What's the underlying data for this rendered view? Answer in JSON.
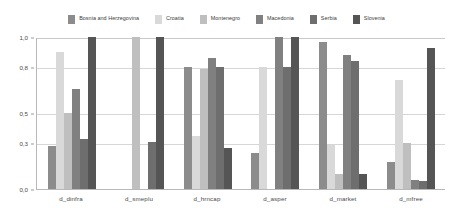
{
  "chart_data": {
    "type": "bar",
    "title": "",
    "subtitle": "",
    "xlabel": "",
    "ylabel": "",
    "ylim": [
      0.0,
      1.0
    ],
    "yticks": [
      "1,0",
      "0,8",
      "0,5",
      "0,3",
      "0,0"
    ],
    "ytick_values": [
      1.0,
      0.8,
      0.5,
      0.3,
      0.0
    ],
    "grid": true,
    "legend_position": "top",
    "categories": [
      "d_dinfra",
      "d_smeplu",
      "d_hrncap",
      "d_asper",
      "d_market",
      "d_mfree"
    ],
    "series": [
      {
        "name": "Bosnia and Herzegovina",
        "color": "#8c8c8c",
        "values": [
          0.28,
          0.0,
          0.8,
          0.24,
          0.97,
          0.18
        ]
      },
      {
        "name": "Croatia",
        "color": "#d9d9d9",
        "values": [
          0.9,
          0.0,
          0.35,
          0.8,
          0.29,
          0.72
        ]
      },
      {
        "name": "Montenegro",
        "color": "#bfbfbf",
        "values": [
          0.5,
          1.0,
          0.79,
          0.0,
          0.1,
          0.3
        ]
      },
      {
        "name": "Macedonia",
        "color": "#808080",
        "values": [
          0.66,
          0.0,
          0.86,
          1.0,
          0.88,
          0.06
        ]
      },
      {
        "name": "Serbia",
        "color": "#6e6e6e",
        "values": [
          0.33,
          0.31,
          0.8,
          0.8,
          0.84,
          0.05
        ]
      },
      {
        "name": "Slovenia",
        "color": "#555555",
        "values": [
          1.0,
          1.0,
          0.27,
          1.0,
          0.1,
          0.93
        ]
      }
    ]
  },
  "axis_colors": {
    "axis_line": "#b8b8b8",
    "gridline": "#d6d6d6",
    "tick_text": "#4a4a4a",
    "legend_text": "#3a3a3a",
    "background": "#ffffff"
  }
}
